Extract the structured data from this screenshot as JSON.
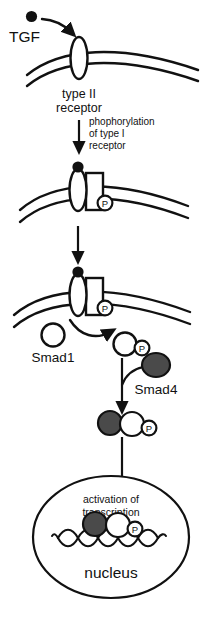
{
  "figure": {
    "type": "biological-pathway-diagram",
    "background_color": "#ffffff",
    "line_color": "#111111",
    "fill_dark": "#4a4a4a",
    "fill_black": "#111111",
    "fill_white": "#ffffff"
  },
  "labels": {
    "ligand": "TGF",
    "receptor_type2_line1": "type II",
    "receptor_type2_line2": "receptor",
    "phosphorylation_line1": "phophorylation",
    "phosphorylation_line2": "of  type I",
    "phosphorylation_line3": "receptor",
    "smad1": "Smad1",
    "smad4": "Smad4",
    "activation_line1": "activation of",
    "activation_line2": "transcription",
    "nucleus": "nucleus",
    "phosphate_badge": "P"
  },
  "stages": [
    {
      "id": "stage-1",
      "name": "ligand-binding",
      "caption": "TGF ligand binds the type II receptor at the plasma membrane"
    },
    {
      "id": "stage-2",
      "name": "type-i-receptor-phosphorylation",
      "caption": "Type I receptor is phosphorylated in the receptor complex"
    },
    {
      "id": "stage-3",
      "name": "smad1-recruitment",
      "caption": "Smad1 is recruited and phosphorylated by the activated receptor"
    },
    {
      "id": "stage-4",
      "name": "smad-complex-formation",
      "caption": "Phosphorylated Smad1 associates with Smad4"
    },
    {
      "id": "stage-5",
      "name": "nuclear-transcription",
      "caption": "Smad complex enters the nucleus and activates transcription on DNA"
    }
  ]
}
